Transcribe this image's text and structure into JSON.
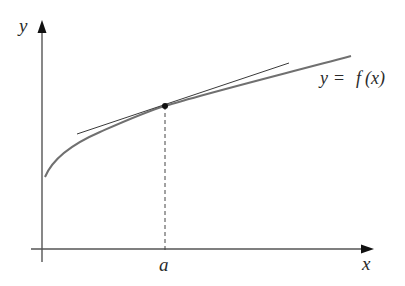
{
  "diagram": {
    "axes": {
      "x_label": "x",
      "y_label": "y"
    },
    "curve": {
      "label_lhs": "y",
      "label_eq": "=",
      "label_fn": "f",
      "label_arg": "(x)",
      "label_full": "y = f(x)",
      "color": "#6b6b6b"
    },
    "tangent": {
      "color": "#3a3a3a"
    },
    "point": {
      "label": "a",
      "color": "#111111"
    },
    "colors": {
      "axis": "#333333",
      "dashed": "#444444",
      "text": "#2a2a2a"
    }
  }
}
